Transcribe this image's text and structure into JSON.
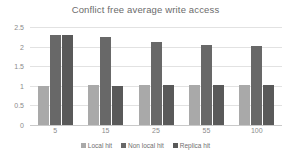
{
  "chart_data": {
    "type": "bar",
    "title": "Conflict free average write access",
    "xlabel": "",
    "ylabel": "",
    "categories": [
      "5",
      "15",
      "25",
      "55",
      "100"
    ],
    "series": [
      {
        "name": "Local hit",
        "values": [
          1.0,
          1.01,
          1.01,
          1.02,
          1.02
        ],
        "color": "#a9a9a9"
      },
      {
        "name": "Non local hit",
        "values": [
          2.3,
          2.25,
          2.13,
          2.03,
          2.01
        ],
        "color": "#686868"
      },
      {
        "name": "Replica hit",
        "values": [
          2.3,
          1.0,
          1.01,
          1.01,
          1.02
        ],
        "color": "#595959"
      }
    ],
    "ylim": [
      0,
      2.5
    ],
    "yticks": [
      "0",
      "0.5",
      "1",
      "1.5",
      "2",
      "2.5"
    ],
    "ytick_values": [
      0,
      0.5,
      1,
      1.5,
      2,
      2.5
    ],
    "grid": true,
    "legend_position": "bottom"
  },
  "colors": {
    "title": "#6b6b6b",
    "tick_text": "#8a8a8a",
    "gridline": "#e2e2e2",
    "axis": "#c9c9c9",
    "background": "#ffffff"
  },
  "legend": {
    "items": [
      {
        "label": "Local hit"
      },
      {
        "label": "Non local hit"
      },
      {
        "label": "Replica hit"
      }
    ]
  }
}
